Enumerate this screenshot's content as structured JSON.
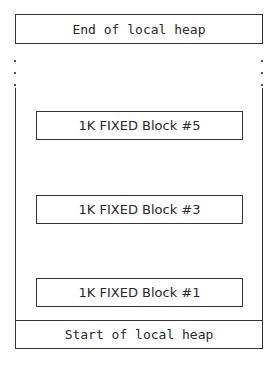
{
  "diagram": {
    "title_top": "End of local heap",
    "title_bottom": "Start of local heap",
    "blocks": [
      {
        "label": "1K FIXED Block #5"
      },
      {
        "label": "1K FIXED Block #3"
      },
      {
        "label": "1K FIXED Block #1"
      }
    ],
    "colors": {
      "line": "#333333",
      "background": "#ffffff"
    }
  }
}
